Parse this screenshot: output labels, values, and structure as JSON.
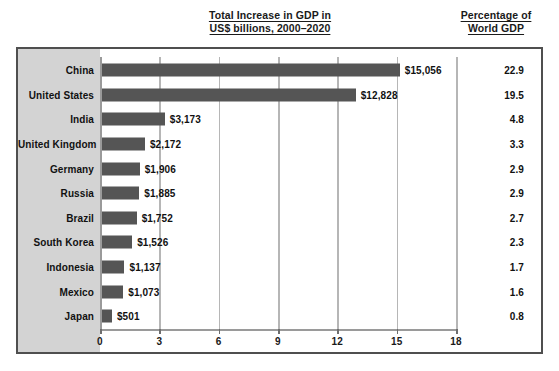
{
  "headings": {
    "chart_title_line1": "Total Increase in GDP in",
    "chart_title_line2": "US$ billions, 2000–2020",
    "pct_title_line1": "Percentage of",
    "pct_title_line2": "World GDP"
  },
  "chart_data": {
    "type": "bar",
    "orientation": "horizontal",
    "title": "Total Increase in GDP in US$ billions, 2000–2020",
    "xlabel": "",
    "ylabel": "",
    "xlim": [
      0,
      18
    ],
    "xticks": [
      "0",
      "3",
      "6",
      "9",
      "12",
      "15",
      "18"
    ],
    "xtick_values": [
      0,
      3,
      6,
      9,
      12,
      15,
      18
    ],
    "x_unit": "US$ trillions (axis) / values labelled in US$ billions",
    "grid": true,
    "legend": false,
    "bar_color": "#555555",
    "categories": [
      "China",
      "United States",
      "India",
      "United Kingdom",
      "Germany",
      "Russia",
      "Brazil",
      "South Korea",
      "Indonesia",
      "Mexico",
      "Japan"
    ],
    "values": [
      15056,
      12828,
      3173,
      2172,
      1906,
      1885,
      1752,
      1526,
      1137,
      1073,
      501
    ],
    "value_labels": [
      "$15,056",
      "$12,828",
      "$3,173",
      "$2,172",
      "$1,906",
      "$1,885",
      "$1,752",
      "$1,526",
      "$1,137",
      "$1,073",
      "$501"
    ],
    "series": [
      {
        "name": "Percentage of World GDP",
        "values": [
          22.9,
          19.5,
          4.8,
          3.3,
          2.9,
          2.9,
          2.7,
          2.3,
          1.7,
          1.6,
          0.8
        ],
        "value_labels": [
          "22.9",
          "19.5",
          "4.8",
          "3.3",
          "2.9",
          "2.9",
          "2.7",
          "2.3",
          "1.7",
          "1.6",
          "0.8"
        ]
      }
    ]
  },
  "rows": [
    {
      "name": "China",
      "value": 15056,
      "label": "$15,056",
      "pct": "22.9"
    },
    {
      "name": "United States",
      "value": 12828,
      "label": "$12,828",
      "pct": "19.5"
    },
    {
      "name": "India",
      "value": 3173,
      "label": "$3,173",
      "pct": "4.8"
    },
    {
      "name": "United Kingdom",
      "value": 2172,
      "label": "$2,172",
      "pct": "3.3"
    },
    {
      "name": "Germany",
      "value": 1906,
      "label": "$1,906",
      "pct": "2.9"
    },
    {
      "name": "Russia",
      "value": 1885,
      "label": "$1,885",
      "pct": "2.9"
    },
    {
      "name": "Brazil",
      "value": 1752,
      "label": "$1,752",
      "pct": "2.7"
    },
    {
      "name": "South Korea",
      "value": 1526,
      "label": "$1,526",
      "pct": "2.3"
    },
    {
      "name": "Indonesia",
      "value": 1137,
      "label": "$1,137",
      "pct": "1.7"
    },
    {
      "name": "Mexico",
      "value": 1073,
      "label": "$1,073",
      "pct": "1.6"
    },
    {
      "name": "Japan",
      "value": 501,
      "label": "$501",
      "pct": "0.8"
    }
  ],
  "colors": {
    "bar": "#555555",
    "label_band": "#d3d3d3",
    "frame_border": "#4f4f4f",
    "gridline": "#b6b6b6",
    "axis": "#9a9a9a",
    "text": "#111111"
  }
}
